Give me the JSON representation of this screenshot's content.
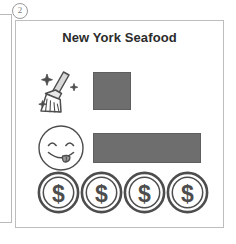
{
  "item_number": "2",
  "card": {
    "title": "New York Seafood",
    "rows": [
      {
        "icon": "broom-sparkle-icon",
        "label": "cleanliness",
        "rating_bar": {
          "kind": "square",
          "width_px": 38,
          "color": "#6e6e6e"
        }
      },
      {
        "icon": "yum-face-icon",
        "label": "taste",
        "rating_bar": {
          "kind": "bar",
          "width_px": 108,
          "color": "#6e6e6e"
        }
      },
      {
        "icon": "dollar-coin-icon",
        "label": "price",
        "coin_count": 4
      }
    ]
  },
  "colors": {
    "bar_fill": "#6e6e6e",
    "bar_stroke": "#5e5e5e",
    "card_border": "#bdbdbd",
    "icon_stroke": "#4d4d4d",
    "title_text": "#2b2b2b"
  }
}
